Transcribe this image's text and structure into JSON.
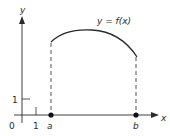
{
  "figure": {
    "curve_label": "y = f(x)",
    "y_axis_label": "y",
    "x_axis_label": "x",
    "origin_label": "0",
    "x_tick_label": "1",
    "y_tick_label": "1",
    "point_a_label": "a",
    "point_b_label": "b",
    "colors": {
      "ink": "#2a2a2a",
      "background": "#ffffff"
    }
  }
}
